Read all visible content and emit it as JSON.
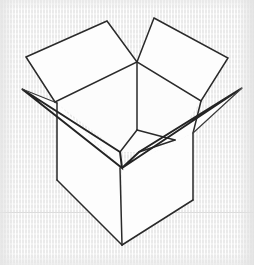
{
  "image": {
    "title": "Open cardboard box line drawing",
    "subject": "open-box",
    "style": "black ink outline sketch on light gray textured paper",
    "width": 254,
    "height": 265
  },
  "colors": {
    "background": "#ededed",
    "paper_texture_light": "#ffffff",
    "paper_texture_dark": "#e9e9e9",
    "ink": "#232323",
    "ink_secondary": "#2a2a2a",
    "face_fill": "#fdfdfd",
    "surface_line": "#dcdcdc"
  },
  "scene": {
    "background_label": "textured light gray paper",
    "surface_line_label": "faint horizontal table edge",
    "surface_line_y": 212
  },
  "shapes": {
    "back_left_flap": {
      "name": "back-left-flap",
      "points": "26,57 107,21 137,62 55,102"
    },
    "back_right_flap": {
      "name": "back-right-flap",
      "points": "154,18 228,58 201,101 137,62"
    },
    "left_side_flap": {
      "name": "left-side-flap",
      "points": "22,89 57,103 122,168 120,152"
    },
    "right_side_flap": {
      "name": "right-side-flap",
      "points": "242,88 193,133 122,168 139,152"
    },
    "box_body_left": {
      "name": "box-body-left-face",
      "points": "57,103 120,168 122,245 57,180"
    },
    "box_body_right": {
      "name": "box-body-right-face",
      "points": "193,133 193,200 122,245 122,168"
    },
    "interior_back_left": {
      "name": "interior-back-left-wall",
      "points": "55,102 137,62 137,130 120,152"
    },
    "interior_back_right": {
      "name": "interior-back-right-wall",
      "points": "137,62 201,101 175,140 137,130"
    },
    "interior_floor": {
      "name": "interior-floor",
      "points": "120,152 137,130 175,140 139,152"
    },
    "strokes": [
      {
        "name": "back-left-flap-outline",
        "d": "M26,57 L107,21 L137,62 L55,102 Z",
        "weight": "thin"
      },
      {
        "name": "back-right-flap-outline",
        "d": "M154,18 L228,58 L201,101 L137,62 Z",
        "weight": "thin"
      },
      {
        "name": "left-flap-upper-edge",
        "d": "M22,89 L120,152",
        "weight": "main"
      },
      {
        "name": "left-flap-lower-edge",
        "d": "M22,89 L122,168",
        "weight": "main"
      },
      {
        "name": "left-flap-inner-fold",
        "d": "M120,152 L122,168",
        "weight": "main"
      },
      {
        "name": "right-flap-upper-edge",
        "d": "M242,88 L139,152",
        "weight": "main"
      },
      {
        "name": "right-flap-lower-edge",
        "d": "M242,88 L122,168",
        "weight": "main"
      },
      {
        "name": "right-flap-inner-fold",
        "d": "M139,152 L122,168",
        "weight": "main"
      },
      {
        "name": "body-left-vertical-edge",
        "d": "M57,103 L57,180",
        "weight": "thin"
      },
      {
        "name": "body-right-vertical-edge",
        "d": "M193,133 L193,200",
        "weight": "thin"
      },
      {
        "name": "body-front-vertical-edge",
        "d": "M120,168 L122,245",
        "weight": "thin"
      },
      {
        "name": "body-bottom-left-edge",
        "d": "M57,180 L122,245",
        "weight": "thin"
      },
      {
        "name": "body-bottom-right-edge",
        "d": "M193,200 L122,245",
        "weight": "thin"
      },
      {
        "name": "interior-back-corner-vertical",
        "d": "M137,62 L137,130",
        "weight": "thin"
      },
      {
        "name": "interior-floor-left-edge",
        "d": "M137,130 L120,152",
        "weight": "thin"
      },
      {
        "name": "interior-floor-right-edge",
        "d": "M137,130 L175,140",
        "weight": "thin"
      },
      {
        "name": "interior-right-wall-edge",
        "d": "M175,140 L139,152",
        "weight": "thin"
      },
      {
        "name": "rim-left-segment",
        "d": "M55,102 L57,103",
        "weight": "thin"
      },
      {
        "name": "rim-right-segment",
        "d": "M201,101 L193,133",
        "weight": "thin"
      }
    ]
  }
}
